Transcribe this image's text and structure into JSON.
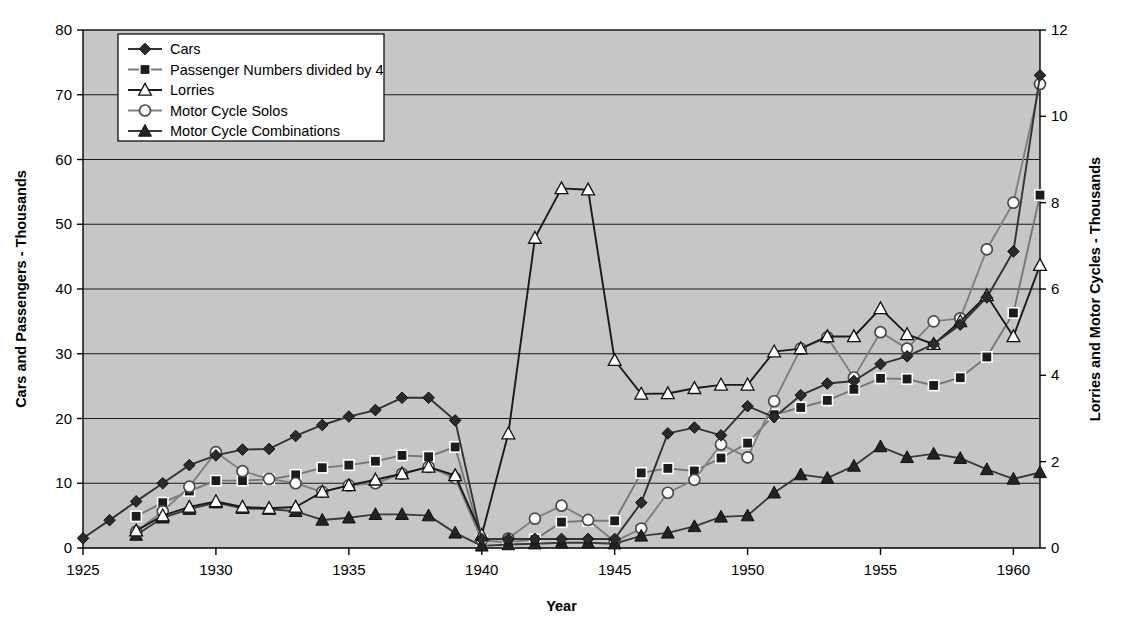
{
  "chart_data": {
    "type": "line",
    "title": "",
    "xlabel": "Year",
    "ylabel": "Cars and Passengers - Thousands",
    "ylabel_right": "Lorries and Motor Cycles - Thousands",
    "xlim": [
      1925,
      1961
    ],
    "ylim": [
      0,
      80
    ],
    "ylim_right": [
      0,
      12
    ],
    "grid": true,
    "legend_position": "top-left",
    "x_ticks": [
      1925,
      1930,
      1935,
      1940,
      1945,
      1950,
      1955,
      1960
    ],
    "y_ticks": [
      0,
      10,
      20,
      30,
      40,
      50,
      60,
      70,
      80
    ],
    "y_ticks_right": [
      0,
      2,
      4,
      6,
      8,
      10,
      12
    ],
    "x": [
      1925,
      1926,
      1927,
      1928,
      1929,
      1930,
      1931,
      1932,
      1933,
      1934,
      1935,
      1936,
      1937,
      1938,
      1939,
      1940,
      1941,
      1942,
      1943,
      1944,
      1945,
      1946,
      1947,
      1948,
      1949,
      1950,
      1951,
      1952,
      1953,
      1954,
      1955,
      1956,
      1957,
      1958,
      1959,
      1960,
      1961
    ],
    "series": [
      {
        "name": "Cars",
        "axis": "left",
        "marker": "diamond-filled",
        "color": "#333333",
        "values": [
          1.5,
          4.3,
          7.2,
          10.0,
          12.8,
          14.3,
          15.2,
          15.3,
          17.3,
          19.0,
          20.3,
          21.3,
          23.2,
          23.2,
          19.7,
          1.4,
          1.4,
          1.4,
          1.4,
          1.4,
          1.4,
          7.0,
          17.7,
          18.6,
          17.4,
          21.9,
          20.2,
          23.6,
          25.4,
          25.8,
          28.4,
          29.6,
          31.5,
          34.5,
          38.7,
          45.8,
          73.0
        ]
      },
      {
        "name": "Passenger Numbers divided by 4",
        "axis": "left",
        "marker": "square-filled",
        "color": "#777777",
        "values": [
          null,
          null,
          4.9,
          7.0,
          8.8,
          10.4,
          10.4,
          10.6,
          11.3,
          12.4,
          12.8,
          13.4,
          14.3,
          14.1,
          15.6,
          1.1,
          0.9,
          1.3,
          4.0,
          4.2,
          4.2,
          11.6,
          12.3,
          11.9,
          13.9,
          16.2,
          20.6,
          21.7,
          22.8,
          24.5,
          26.2,
          26.1,
          25.1,
          26.3,
          29.5,
          36.3,
          54.5
        ]
      },
      {
        "name": "Lorries",
        "axis": "right",
        "marker": "triangle-open",
        "color": "#1a1a1a",
        "values": [
          null,
          null,
          0.4,
          0.75,
          0.95,
          1.08,
          0.95,
          0.92,
          0.95,
          1.3,
          1.45,
          1.58,
          1.72,
          1.88,
          1.68,
          0.3,
          2.65,
          7.18,
          8.33,
          8.3,
          4.35,
          3.57,
          3.58,
          3.7,
          3.78,
          3.78,
          4.55,
          4.62,
          4.9,
          4.9,
          5.55,
          4.95,
          4.72,
          5.25,
          5.85,
          4.9,
          6.55
        ]
      },
      {
        "name": "Motor Cycle Solos",
        "axis": "right",
        "marker": "circle-open",
        "color": "#808080",
        "values": [
          null,
          null,
          0.38,
          0.85,
          1.42,
          2.22,
          1.78,
          1.6,
          1.5,
          1.3,
          1.45,
          1.5,
          1.72,
          1.88,
          1.62,
          0.18,
          0.22,
          0.68,
          0.98,
          0.65,
          0.15,
          0.45,
          1.28,
          1.58,
          2.4,
          2.1,
          3.4,
          4.62,
          4.88,
          3.95,
          5.0,
          4.62,
          5.25,
          5.32,
          6.92,
          8.0,
          10.75
        ]
      },
      {
        "name": "Motor Cycle Combinations",
        "axis": "right",
        "marker": "triangle-filled",
        "color": "#3a3a3a",
        "values": [
          null,
          null,
          0.3,
          0.7,
          0.9,
          1.05,
          0.92,
          0.9,
          0.85,
          0.65,
          0.7,
          0.78,
          0.78,
          0.75,
          0.35,
          0.05,
          0.08,
          0.1,
          0.12,
          0.12,
          0.1,
          0.28,
          0.35,
          0.5,
          0.72,
          0.75,
          1.28,
          1.7,
          1.62,
          1.9,
          2.35,
          2.1,
          2.18,
          2.08,
          1.82,
          1.6,
          1.75
        ]
      }
    ]
  },
  "legend": {
    "items": [
      {
        "label": "Cars"
      },
      {
        "label": "Passenger Numbers divided by 4"
      },
      {
        "label": "Lorries"
      },
      {
        "label": "Motor Cycle Solos"
      },
      {
        "label": "Motor Cycle Combinations"
      }
    ]
  },
  "colors": {
    "plot_background": "#c6c6c6",
    "page_background": "#ffffff",
    "axis": "#000000",
    "gridline": "#1a1a1a"
  }
}
